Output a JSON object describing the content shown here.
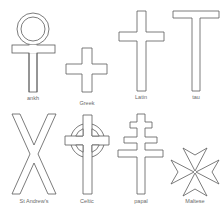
{
  "colors": {
    "line": "#5a5a5a",
    "label": "#6a6a6a",
    "background": "#ffffff"
  },
  "crosses": [
    {
      "id": "ankh",
      "label": "ankh",
      "label_x": 33,
      "label_y": 96
    },
    {
      "id": "greek",
      "label": "Greek",
      "label_x": 87,
      "label_y": 102
    },
    {
      "id": "latin",
      "label": "Latin",
      "label_x": 141,
      "label_y": 96
    },
    {
      "id": "tau",
      "label": "tau",
      "label_x": 196,
      "label_y": 96
    },
    {
      "id": "st-andrews",
      "label": "St Andrew's",
      "label_x": 34,
      "label_y": 200
    },
    {
      "id": "celtic",
      "label": "Celtic",
      "label_x": 87,
      "label_y": 200
    },
    {
      "id": "papal",
      "label": "papal",
      "label_x": 141,
      "label_y": 200
    },
    {
      "id": "maltese",
      "label": "Maltese",
      "label_x": 195,
      "label_y": 200
    }
  ]
}
